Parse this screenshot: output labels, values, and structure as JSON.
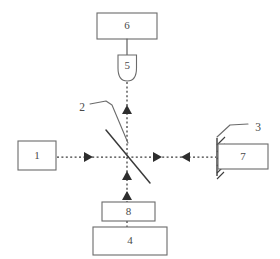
{
  "diagram": {
    "canvas": {
      "width": 280,
      "height": 259,
      "background": "#ffffff"
    },
    "colors": {
      "stroke": "#6b6b6b",
      "beam": "#3d3d3d",
      "text": "#4a4a4a",
      "background": "#ffffff"
    },
    "components": [
      {
        "id": "1",
        "label": "1",
        "shape": "rectangle",
        "name": "component-box-1",
        "x": 18,
        "y": 141,
        "width": 38,
        "height": 29
      },
      {
        "id": "2",
        "label": "2",
        "shape": "diagonal-line",
        "name": "component-beamsplitter-2",
        "label_x": 84,
        "label_y": 108
      },
      {
        "id": "3",
        "label": "3",
        "shape": "hatched-mirror",
        "name": "component-mirror-3",
        "label_x": 258,
        "label_y": 128
      },
      {
        "id": "4",
        "label": "4",
        "shape": "rectangle",
        "name": "component-box-4",
        "x": 93,
        "y": 227,
        "width": 74,
        "height": 28
      },
      {
        "id": "5",
        "label": "5",
        "shape": "bullet",
        "name": "component-detector-5",
        "x": 118,
        "y": 55,
        "width": 19,
        "height": 26
      },
      {
        "id": "6",
        "label": "6",
        "shape": "rectangle",
        "name": "component-box-6",
        "x": 97,
        "y": 13,
        "width": 60,
        "height": 26
      },
      {
        "id": "7",
        "label": "7",
        "shape": "rectangle",
        "name": "component-box-7",
        "x": 218,
        "y": 144,
        "width": 50,
        "height": 25
      },
      {
        "id": "8",
        "label": "8",
        "shape": "rectangle",
        "name": "component-box-8",
        "x": 102,
        "y": 202,
        "width": 53,
        "height": 19
      }
    ],
    "beams": [
      {
        "name": "beam-horizontal-left",
        "from": "1",
        "to": "2",
        "direction": "right"
      },
      {
        "name": "beam-horizontal-right",
        "from": "2",
        "to": "3",
        "direction": "bidirectional"
      },
      {
        "name": "beam-vertical-up",
        "from": "2",
        "to": "5",
        "direction": "up"
      },
      {
        "name": "beam-vertical-down",
        "from": "2",
        "to": "8",
        "direction": "up"
      }
    ],
    "connections": [
      {
        "name": "link-6-to-5",
        "from": "6",
        "to": "5",
        "style": "solid"
      },
      {
        "name": "leader-label-2",
        "from": "2",
        "style": "leader"
      },
      {
        "name": "leader-label-3",
        "from": "3",
        "style": "leader"
      }
    ]
  }
}
